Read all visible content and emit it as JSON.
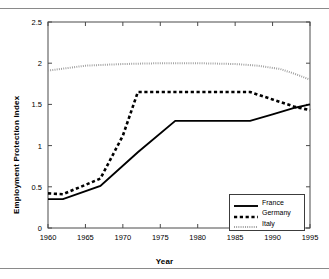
{
  "figure": {
    "rules": [
      "top-rule",
      "bottom-rule"
    ]
  },
  "chart_data": {
    "type": "line",
    "title": "",
    "xlabel": "Year",
    "ylabel": "Employment Protection Index",
    "xlim": [
      1960,
      1995
    ],
    "ylim": [
      0,
      2.5
    ],
    "xticks": [
      1960,
      1965,
      1970,
      1975,
      1980,
      1985,
      1990,
      1995
    ],
    "xtick_labels": [
      "1960",
      "1965",
      "1970",
      "1975",
      "1980",
      "1985",
      "1990",
      "1995"
    ],
    "yticks": [
      0,
      0.5,
      1,
      1.5,
      2,
      2.5
    ],
    "ytick_labels": [
      "0",
      "0.5",
      "1",
      "1.5",
      "2",
      "2.5"
    ],
    "grid": false,
    "legend_position": "lower right",
    "series": [
      {
        "name": "France",
        "style": "solid",
        "color": "#000000",
        "x": [
          1960,
          1962,
          1967,
          1972,
          1977,
          1987,
          1990,
          1993,
          1995
        ],
        "values": [
          0.35,
          0.35,
          0.51,
          0.92,
          1.3,
          1.3,
          1.38,
          1.46,
          1.5
        ]
      },
      {
        "name": "Germany",
        "style": "dashed",
        "color": "#000000",
        "x": [
          1960,
          1962,
          1967,
          1970,
          1972,
          1977,
          1987,
          1990,
          1993,
          1995
        ],
        "values": [
          0.42,
          0.41,
          0.6,
          1.12,
          1.65,
          1.65,
          1.65,
          1.56,
          1.47,
          1.43
        ]
      },
      {
        "name": "Italy",
        "style": "dotted",
        "color": "#9a9a9a",
        "x": [
          1960,
          1965,
          1970,
          1975,
          1980,
          1985,
          1988,
          1991,
          1993,
          1995
        ],
        "values": [
          1.91,
          1.97,
          1.99,
          2.0,
          2.0,
          1.99,
          1.97,
          1.93,
          1.87,
          1.8
        ]
      }
    ],
    "legend": [
      {
        "label": "France",
        "style": "solid"
      },
      {
        "label": "Germany",
        "style": "dashed"
      },
      {
        "label": "Italy",
        "style": "dotted"
      }
    ]
  }
}
